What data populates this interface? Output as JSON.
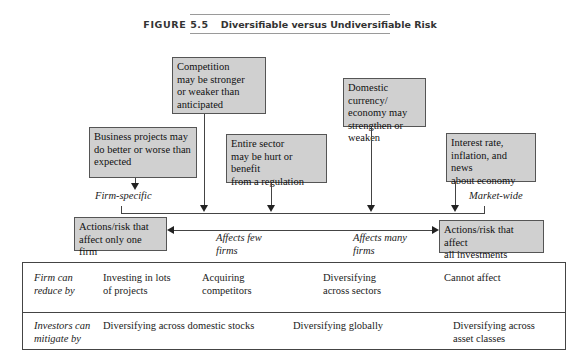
{
  "figure": {
    "number": "FIGURE 5.5",
    "title": "Diversifiable versus Undiversifiable Risk"
  },
  "sources": {
    "competition": {
      "lines": [
        "Competition",
        "may be stronger",
        "or weaker than",
        "anticipated"
      ]
    },
    "domestic": {
      "lines": [
        "Domestic currency/",
        "economy may",
        "strengthen or weaken"
      ]
    },
    "business": {
      "lines": [
        "Business projects may",
        "do better or worse than",
        "expected"
      ]
    },
    "sector": {
      "lines": [
        "Entire sector",
        "may be hurt or benefit",
        "from a regulation"
      ]
    },
    "interest": {
      "lines": [
        "Interest rate,",
        "inflation, and news",
        "about economy"
      ]
    }
  },
  "spectrum": {
    "left_label": "Firm-specific",
    "right_label": "Market-wide",
    "left_box": {
      "lines": [
        "Actions/risk that",
        "affect only one firm"
      ]
    },
    "right_box": {
      "lines": [
        "Actions/risk that affect",
        "all investments"
      ]
    },
    "few": {
      "lines": [
        "Affects few",
        "firms"
      ]
    },
    "many": {
      "lines": [
        "Affects many",
        "firms"
      ]
    }
  },
  "table": {
    "rows": [
      {
        "label": [
          "Firm can",
          "reduce by"
        ],
        "cells": [
          [
            "Investing in lots",
            "of projects"
          ],
          [
            "Acquiring",
            "competitors"
          ],
          [
            "Diversifying",
            "across sectors"
          ],
          [
            "Cannot affect"
          ]
        ]
      },
      {
        "label": [
          "Investors can",
          "mitigate by"
        ],
        "cells": [
          [
            "Diversifying across domestic stocks"
          ],
          [
            "Diversifying globally"
          ],
          [
            "Diversifying across",
            "asset classes"
          ]
        ]
      }
    ]
  },
  "colors": {
    "box_fill": "#d0d0d0",
    "line": "#444444"
  }
}
